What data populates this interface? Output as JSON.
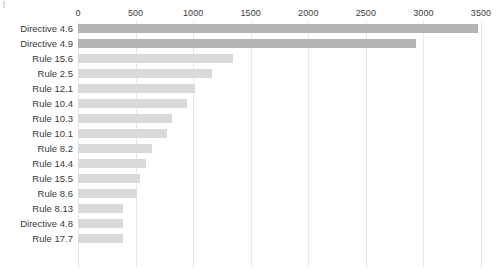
{
  "chart_data": {
    "type": "bar",
    "orientation": "horizontal",
    "title": "",
    "subtitle": "",
    "xlabel": "",
    "ylabel": "",
    "xlim": [
      0,
      3500
    ],
    "ylim": null,
    "grid": true,
    "grid_axis": "x",
    "legend": false,
    "legend_position": "none",
    "axis_position": "top",
    "xticks": [
      0,
      500,
      1000,
      1500,
      2000,
      2500,
      3000,
      3500
    ],
    "xtick_labels": [
      "0",
      "500",
      "1000",
      "1500",
      "2000",
      "2500",
      "3000",
      "3500"
    ],
    "categories": [
      "Directive 4.6",
      "Directive 4.9",
      "Rule 15.6",
      "Rule 2.5",
      "Rule 12.1",
      "Rule 10.4",
      "Rule 10.3",
      "Rule 10.1",
      "Rule 8.2",
      "Rule 14.4",
      "Rule 15.5",
      "Rule 8.6",
      "Rule 8.13",
      "Directive 4.8",
      "Rule 17.7"
    ],
    "values": [
      3470,
      2935,
      1345,
      1163,
      1015,
      945,
      815,
      770,
      645,
      590,
      540,
      510,
      395,
      390,
      390
    ],
    "bar_colors": [
      "#b4b4b4",
      "#b4b4b4",
      "#d9d9d9",
      "#d9d9d9",
      "#d9d9d9",
      "#d9d9d9",
      "#d9d9d9",
      "#d9d9d9",
      "#d9d9d9",
      "#d9d9d9",
      "#d9d9d9",
      "#d9d9d9",
      "#d9d9d9",
      "#d9d9d9",
      "#d9d9d9"
    ],
    "colors": {
      "highlight_bar": "#b4b4b4",
      "bar": "#d9d9d9",
      "gridline": "#e9e9e9",
      "tick_label": "#3d3d3d",
      "category_label": "#3a3a3a",
      "background": "#ffffff"
    }
  }
}
